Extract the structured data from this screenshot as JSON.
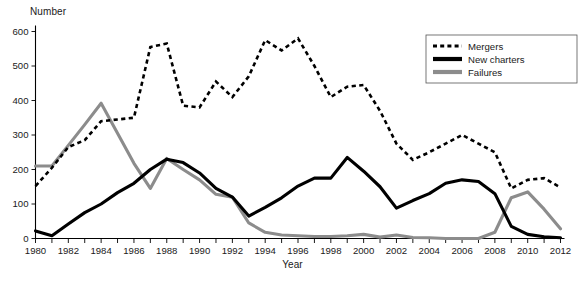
{
  "chart_data": {
    "type": "line",
    "title": "",
    "xlabel": "Year",
    "ylabel": "Number",
    "xlim": [
      1980,
      2012
    ],
    "ylim": [
      0,
      600
    ],
    "ytick_values": [
      0,
      100,
      200,
      300,
      400,
      500,
      600
    ],
    "ytick_labels": [
      "0",
      "100",
      "200",
      "300",
      "400",
      "500",
      "600"
    ],
    "xtick_values": [
      1980,
      1982,
      1984,
      1986,
      1988,
      1990,
      1992,
      1994,
      1996,
      1998,
      2000,
      2002,
      2004,
      2006,
      2008,
      2010,
      2012
    ],
    "xtick_labels": [
      "1980",
      "1982",
      "1984",
      "1986",
      "1988",
      "1990",
      "1992",
      "1994",
      "1996",
      "1998",
      "2000",
      "2002",
      "2004",
      "2006",
      "2008",
      "2010",
      "2012"
    ],
    "x": [
      1980,
      1981,
      1982,
      1983,
      1984,
      1985,
      1986,
      1987,
      1988,
      1989,
      1990,
      1991,
      1992,
      1993,
      1994,
      1995,
      1996,
      1997,
      1998,
      1999,
      2000,
      2001,
      2002,
      2003,
      2004,
      2005,
      2006,
      2007,
      2008,
      2009,
      2010,
      2011,
      2012
    ],
    "grid": false,
    "legend_position": "top-right",
    "series": [
      {
        "name": "Mergers",
        "style": "dotted",
        "color": "#000000",
        "values": [
          152,
          205,
          265,
          285,
          340,
          345,
          350,
          555,
          565,
          385,
          380,
          455,
          410,
          470,
          575,
          545,
          580,
          500,
          410,
          440,
          445,
          370,
          275,
          228,
          250,
          275,
          300,
          275,
          250,
          145,
          170,
          175,
          148
        ]
      },
      {
        "name": "New charters",
        "style": "solid",
        "color": "#000000",
        "values": [
          22,
          8,
          42,
          75,
          100,
          133,
          160,
          200,
          230,
          220,
          190,
          145,
          120,
          65,
          90,
          118,
          152,
          175,
          175,
          235,
          195,
          150,
          88,
          110,
          130,
          160,
          170,
          165,
          130,
          35,
          12,
          5,
          2
        ]
      },
      {
        "name": "Failures",
        "style": "solid",
        "color": "#8c8c8c",
        "values": [
          210,
          210,
          270,
          330,
          392,
          305,
          218,
          145,
          232,
          200,
          170,
          128,
          120,
          45,
          18,
          10,
          8,
          6,
          6,
          8,
          12,
          4,
          10,
          3,
          2,
          0,
          0,
          0,
          18,
          118,
          135,
          85,
          28
        ]
      }
    ]
  },
  "legend": {
    "items": [
      {
        "label": "Mergers",
        "style": "dotted",
        "color": "#000000"
      },
      {
        "label": "New charters",
        "style": "solid",
        "color": "#000000"
      },
      {
        "label": "Failures",
        "style": "solid",
        "color": "#8c8c8c"
      }
    ]
  },
  "axes": {
    "y_title": "Number",
    "x_title": "Year"
  }
}
